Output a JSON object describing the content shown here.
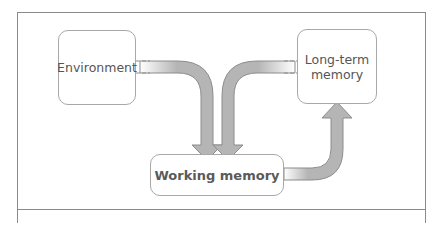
{
  "diagram": {
    "nodes": {
      "environment": {
        "label": "Environment"
      },
      "long_term_memory": {
        "label": "Long-term memory",
        "line1": "Long-term",
        "line2": "memory"
      },
      "working_memory": {
        "label": "Working memory"
      }
    },
    "edges": [
      {
        "from": "Environment",
        "to": "Working memory"
      },
      {
        "from": "Long-term memory",
        "to": "Working memory"
      },
      {
        "from": "Working memory",
        "to": "Long-term memory"
      }
    ],
    "colors": {
      "arrow_fill": "#b5b5b5",
      "arrow_stroke": "#8c8c8c",
      "box_border": "#a8a8a8",
      "frame_border": "#8a8a8a",
      "text": "#555555"
    }
  }
}
